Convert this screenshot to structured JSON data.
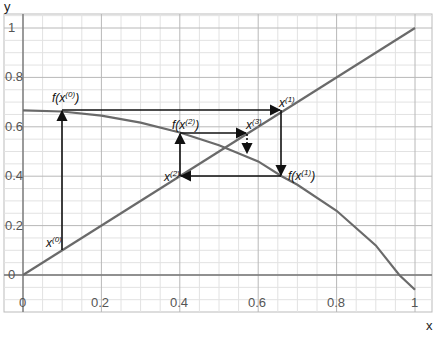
{
  "chart_data": {
    "type": "line",
    "title": "",
    "xlabel": "x",
    "ylabel": "y",
    "xlim": [
      -0.05,
      1.05
    ],
    "ylim": [
      -0.15,
      1.06
    ],
    "grid": true,
    "x_ticks": [
      "0",
      "0.2",
      "0.4",
      "0.6",
      "0.8",
      "1"
    ],
    "y_ticks": [
      "0",
      "0.2",
      "0.4",
      "0.6",
      "0.8",
      "1"
    ],
    "series": [
      {
        "name": "y = x",
        "x": [
          0,
          1
        ],
        "y": [
          0,
          1
        ],
        "color": "#666666"
      },
      {
        "name": "y = f(x)",
        "x": [
          0,
          0.1,
          0.2,
          0.3,
          0.4,
          0.5,
          0.6,
          0.66,
          0.7,
          0.8,
          0.9,
          0.96,
          1.0
        ],
        "y": [
          0.667,
          0.662,
          0.645,
          0.617,
          0.577,
          0.525,
          0.46,
          0.4,
          0.365,
          0.26,
          0.12,
          0.0,
          -0.06
        ],
        "color": "#666666"
      }
    ],
    "cobweb_path": [
      {
        "x": 0.1,
        "y": 0.1
      },
      {
        "x": 0.1,
        "y": 0.667
      },
      {
        "x": 0.66,
        "y": 0.667
      },
      {
        "x": 0.66,
        "y": 0.4
      },
      {
        "x": 0.4,
        "y": 0.4
      },
      {
        "x": 0.4,
        "y": 0.575
      },
      {
        "x": 0.575,
        "y": 0.575
      },
      {
        "x": 0.575,
        "y": 0.515
      }
    ],
    "annotations": [
      {
        "base": "x",
        "sup": "(0)",
        "x": 0.1,
        "y": 0.1
      },
      {
        "base": "f(x",
        "sup": "(0)",
        "tail": ")",
        "x": 0.1,
        "y": 0.667
      },
      {
        "base": "x",
        "sup": "(1)",
        "x": 0.66,
        "y": 0.667
      },
      {
        "base": "f(x",
        "sup": "(1)",
        "tail": ")",
        "x": 0.66,
        "y": 0.4
      },
      {
        "base": "x",
        "sup": "(2)",
        "x": 0.4,
        "y": 0.4
      },
      {
        "base": "f(x",
        "sup": "(2)",
        "tail": ")",
        "x": 0.4,
        "y": 0.575
      },
      {
        "base": "x",
        "sup": "(3)",
        "x": 0.575,
        "y": 0.575
      }
    ]
  },
  "labels": {
    "xlabel": "x",
    "ylabel": "y",
    "xticks": [
      "0",
      "0.2",
      "0.4",
      "0.6",
      "0.8",
      "1"
    ],
    "yticks": [
      "0",
      "0.2",
      "0.4",
      "0.6",
      "0.8",
      "1"
    ],
    "x0": {
      "base": "x",
      "sup": "(0)"
    },
    "fx0": {
      "base": "f(x",
      "sup": "(0)",
      "tail": ")"
    },
    "x1": {
      "base": "x",
      "sup": "(1)"
    },
    "fx1": {
      "base": "f(x",
      "sup": "(1)",
      "tail": ")"
    },
    "x2": {
      "base": "x",
      "sup": "(2)"
    },
    "fx2": {
      "base": "f(x",
      "sup": "(2)",
      "tail": ")"
    },
    "x3": {
      "base": "x",
      "sup": "(3)"
    }
  }
}
